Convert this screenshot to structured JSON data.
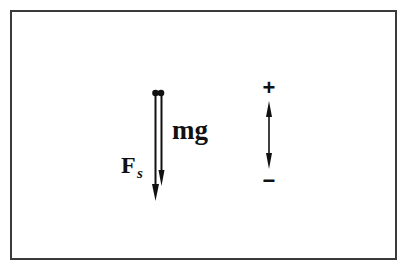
{
  "diagram": {
    "type": "free-body-diagram",
    "colors": {
      "ink": "#111111",
      "frame": "#3a3a3a",
      "background": "#ffffff"
    },
    "forces": [
      {
        "id": "spring-force",
        "label": "F",
        "subscript": "s",
        "direction": "down",
        "relative_length": "longer"
      },
      {
        "id": "weight",
        "label": "mg",
        "direction": "down",
        "relative_length": "shorter"
      }
    ],
    "origin_point": "body (dot) at top of arrows",
    "sign_convention": {
      "positive_label": "+",
      "negative_label": "−",
      "axis": "vertical, up is positive"
    }
  }
}
